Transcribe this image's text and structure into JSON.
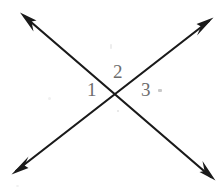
{
  "figure": {
    "kind": "geometry-diagram",
    "width": 222,
    "height": 193,
    "background_color": "#ffffff",
    "ink_color": "#1a1a1a",
    "label_color": "#6d6d6d"
  },
  "lines": [
    {
      "id": "line-nw-se",
      "name": "line-northwest-southeast",
      "from": {
        "x": 20,
        "y": 13
      },
      "to": {
        "x": 215,
        "y": 180
      },
      "arrowheads": "both",
      "stroke_width": 2.2,
      "color": "#1a1a1a"
    },
    {
      "id": "line-ne-sw",
      "name": "line-northeast-southwest",
      "from": {
        "x": 213,
        "y": 18
      },
      "to": {
        "x": 12,
        "y": 174
      },
      "arrowheads": "both",
      "stroke_width": 2.2,
      "color": "#1a1a1a"
    }
  ],
  "intersection": {
    "label": "",
    "x": 117,
    "y": 94
  },
  "angle_labels": [
    {
      "id": "1",
      "text": "1",
      "position": "left-of-intersection",
      "x": 87,
      "y": 80
    },
    {
      "id": "2",
      "text": "2",
      "position": "above-intersection",
      "x": 113,
      "y": 62
    },
    {
      "id": "3",
      "text": "3",
      "position": "right-of-intersection",
      "x": 141,
      "y": 80
    }
  ],
  "artifacts": {
    "note": "faint scanner speckles on white background"
  }
}
